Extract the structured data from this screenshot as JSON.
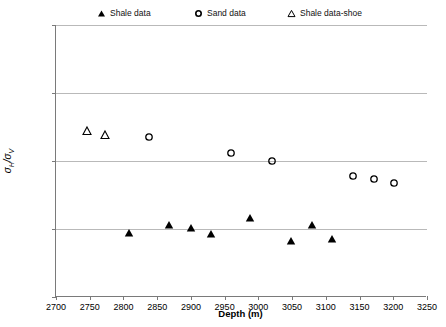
{
  "chart_data": {
    "type": "scatter",
    "title": "",
    "xlabel": "Depth (m)",
    "ylabel": "σH/σV",
    "xlim": [
      2700,
      3250
    ],
    "ylim": [
      0.9,
      1.1
    ],
    "xticks": [
      2700,
      2750,
      2800,
      2850,
      2900,
      2950,
      3000,
      3050,
      3100,
      3150,
      3200,
      3250
    ],
    "yticks": [
      0.9,
      0.95,
      1.0,
      1.05,
      1.1
    ],
    "ytick_labels": [
      "0.900",
      "0.950",
      "1.000",
      "1.050",
      "1.100"
    ],
    "xtick_labels": [
      "2700",
      "2750",
      "2800",
      "2850",
      "2900",
      "2950",
      "3000",
      "3050",
      "3100",
      "3150",
      "3200",
      "3250"
    ],
    "grid": "horizontal",
    "legend_position": "top",
    "series": [
      {
        "name": "Shale data",
        "marker": "triangle-filled",
        "color": "#000000",
        "points": [
          {
            "x": 2808,
            "y": 0.947
          },
          {
            "x": 2868,
            "y": 0.953
          },
          {
            "x": 2900,
            "y": 0.951
          },
          {
            "x": 2930,
            "y": 0.946
          },
          {
            "x": 2988,
            "y": 0.958
          },
          {
            "x": 3048,
            "y": 0.941
          },
          {
            "x": 3080,
            "y": 0.953
          },
          {
            "x": 3109,
            "y": 0.943
          }
        ]
      },
      {
        "name": "Sand data",
        "marker": "circle-open",
        "color": "#000000",
        "points": [
          {
            "x": 2838,
            "y": 1.018
          },
          {
            "x": 2960,
            "y": 1.006
          },
          {
            "x": 3020,
            "y": 1.0
          },
          {
            "x": 3140,
            "y": 0.989
          },
          {
            "x": 3171,
            "y": 0.987
          },
          {
            "x": 3201,
            "y": 0.984
          }
        ]
      },
      {
        "name": "Shale data-shoe",
        "marker": "triangle-open",
        "color": "#000000",
        "points": [
          {
            "x": 2746,
            "y": 1.022
          },
          {
            "x": 2773,
            "y": 1.019
          }
        ]
      }
    ]
  },
  "legend": {
    "items": [
      {
        "label": "Shale data",
        "marker": "triangle-filled"
      },
      {
        "label": "Sand data",
        "marker": "circle-open"
      },
      {
        "label": "Shale data-shoe",
        "marker": "triangle-open"
      }
    ]
  },
  "axes": {
    "x_title": "Depth (m)",
    "y_title_numerator": "H",
    "y_title_denominator": "V"
  }
}
